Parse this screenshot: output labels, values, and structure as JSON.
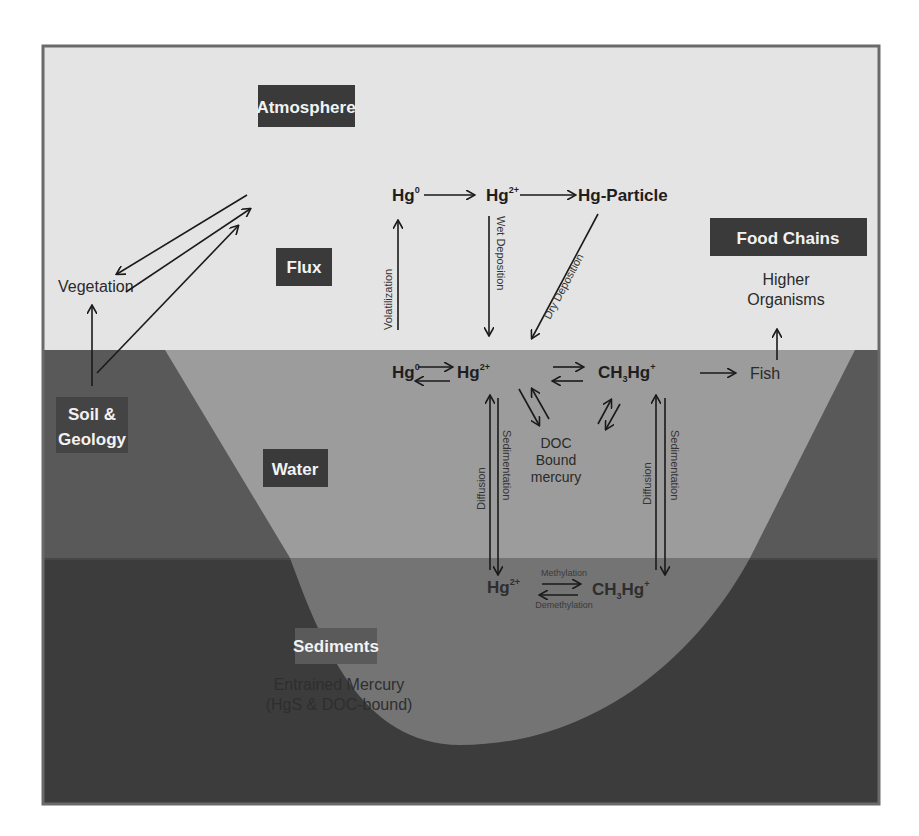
{
  "colors": {
    "atmosphere": "#e4e4e4",
    "water": "#9c9c9c",
    "sediment": "#737373",
    "soil": "#5a5a5a",
    "deep_ground": "#3c3c3c",
    "label_box": "#3a3a3a",
    "frame": "#6a6a6a"
  },
  "compartments": {
    "atmosphere": "Atmosphere",
    "flux": "Flux",
    "food_chains": "Food Chains",
    "soil_line1": "Soil &",
    "soil_line2": "Geology",
    "water": "Water",
    "sediments": "Sediments"
  },
  "atmosphere_species": {
    "hg0": "Hg",
    "hg0_sup": "0",
    "hg2": "Hg",
    "hg2_sup": "2+",
    "particle": "Hg-Particle"
  },
  "water_species": {
    "hg0": "Hg",
    "hg0_sup": "0",
    "hg2": "Hg",
    "hg2_sup": "2+",
    "mehg": "CH",
    "mehg_sub": "3",
    "mehg_hg": "Hg",
    "mehg_sup": "+",
    "fish": "Fish"
  },
  "sediment_species": {
    "hg2": "Hg",
    "hg2_sup": "2+",
    "mehg": "CH",
    "mehg_sub": "3",
    "mehg_hg": "Hg",
    "mehg_sup": "+"
  },
  "labels": {
    "vegetation": "Vegetation",
    "higher_organisms_1": "Higher",
    "higher_organisms_2": "Organisms",
    "doc_1": "DOC",
    "doc_2": "Bound",
    "doc_3": "mercury",
    "entrained_1": "Entrained Mercury",
    "entrained_2": "(HgS & DOC-bound)"
  },
  "processes": {
    "volatilization": "Volatilization",
    "wet_deposition": "Wet Deposition",
    "dry_deposition": "Dry Deposition",
    "diffusion": "Diffusion",
    "sedimentation": "Sedimentation",
    "methylation": "Methylation",
    "demethylation": "Demethylation"
  }
}
